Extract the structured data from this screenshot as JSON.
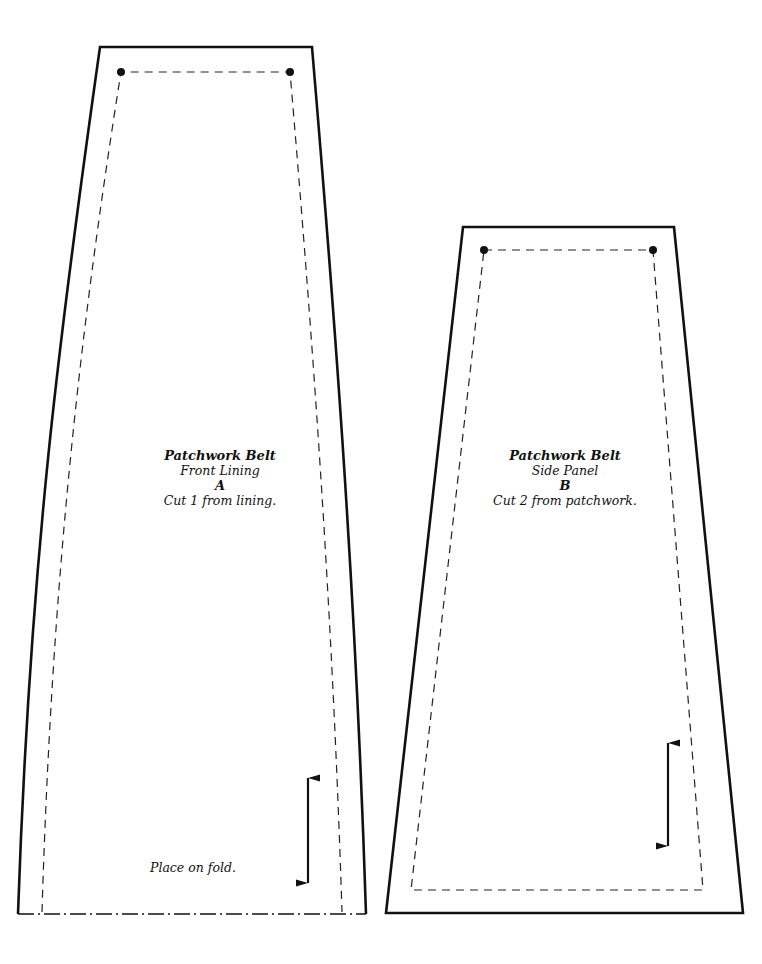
{
  "pieces": [
    {
      "id": "A",
      "title": "Patchwork Belt",
      "subtitle": "Front Lining",
      "letter": "A",
      "instruction": "Cut 1 from lining.",
      "fold_text": "Place on fold.",
      "markings": [
        "seam-allowance-dashed-line",
        "dot-marker-top-left",
        "dot-marker-top-right",
        "grainline-arrow",
        "fold-line-dash-dot"
      ]
    },
    {
      "id": "B",
      "title": "Patchwork Belt",
      "subtitle": "Side Panel",
      "letter": "B",
      "instruction": "Cut 2 from patchwork.",
      "markings": [
        "seam-allowance-dashed-line",
        "dot-marker-top-left",
        "dot-marker-top-right",
        "grainline-arrow"
      ]
    }
  ],
  "colors": {
    "line": "#111111",
    "background": "#ffffff"
  }
}
